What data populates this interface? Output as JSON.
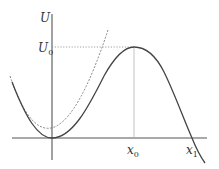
{
  "diagram": {
    "axes": {
      "y_label": "U",
      "y_marker_label": "U",
      "y_marker_subscript": "0",
      "x_marker_0_label": "x",
      "x_marker_0_subscript": "0",
      "x_marker_1_label": "x",
      "x_marker_1_subscript": "1"
    },
    "curves": [
      {
        "name": "potential-curve",
        "style": "solid",
        "description": "U(x) with minimum at origin, maximum U0 at x0, crossing zero at x1"
      },
      {
        "name": "parabolic-approximation",
        "style": "dashed",
        "description": "harmonic approximation near the minimum"
      }
    ],
    "guides": [
      {
        "name": "u0-level-line",
        "style": "dotted"
      },
      {
        "name": "x0-drop-line",
        "style": "solid-thin"
      }
    ],
    "colors": {
      "curve": "#444444",
      "axis": "#555555",
      "guide": "#888888",
      "text": "#333333"
    }
  }
}
